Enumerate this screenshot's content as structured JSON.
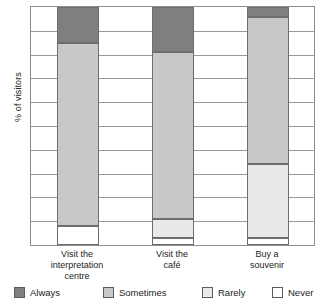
{
  "chart_data": {
    "type": "bar",
    "subtype": "stacked-column-100",
    "title": "",
    "xlabel": "",
    "ylabel": "% of visitors",
    "ylim": [
      0,
      100
    ],
    "grid": true,
    "gridlines_count": 10,
    "y_tick_labels": [],
    "legend_position": "bottom",
    "categories": [
      "Visit the interpretation centre",
      "Visit the café",
      "Buy a souvenir"
    ],
    "category_lines": [
      [
        "Visit the",
        "interpretation",
        "centre"
      ],
      [
        "Visit the",
        "café"
      ],
      [
        "Buy a",
        "souvenir"
      ]
    ],
    "series": [
      {
        "name": "Always",
        "color": "#7f7f7f",
        "values": [
          15,
          19,
          4
        ]
      },
      {
        "name": "Sometimes",
        "color": "#c8c8c8",
        "values": [
          77,
          70,
          62
        ]
      },
      {
        "name": "Rarely",
        "color": "#e9e9e9",
        "values": [
          0,
          8,
          31
        ]
      },
      {
        "name": "Never",
        "color": "#ffffff",
        "values": [
          8,
          3,
          3
        ]
      }
    ]
  },
  "axis": {
    "y_title": "% of visitors"
  },
  "legend": {
    "items": [
      {
        "label": "Always",
        "swatch": "legend-swatch-always"
      },
      {
        "label": "Sometimes",
        "swatch": "legend-swatch-sometimes"
      },
      {
        "label": "Rarely",
        "swatch": "legend-swatch-rarely"
      },
      {
        "label": "Never",
        "swatch": "legend-swatch-never"
      }
    ]
  },
  "colors": {
    "always": "#7f7f7f",
    "sometimes": "#c8c8c8",
    "rarely": "#e9e9e9",
    "never": "#ffffff",
    "axis": "#8e8e8e",
    "grid": "#9a9a9a",
    "text": "#232323"
  }
}
